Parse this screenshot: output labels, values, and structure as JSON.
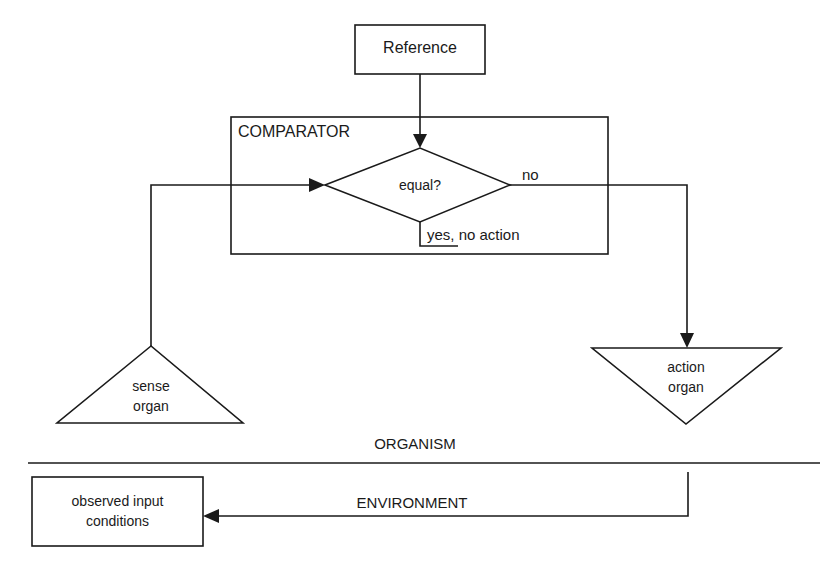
{
  "diagram": {
    "reference": {
      "label": "Reference"
    },
    "comparator": {
      "label": "COMPARATOR",
      "decision": "equal?",
      "no_label": "no",
      "yes_label": "yes, no action"
    },
    "sense_organ": {
      "line1": "sense",
      "line2": "organ"
    },
    "action_organ": {
      "line1": "action",
      "line2": "organ"
    },
    "organism_label": "ORGANISM",
    "environment_label": "ENVIRONMENT",
    "observed_input": {
      "line1": "observed input",
      "line2": "conditions"
    },
    "stroke_color": "#1a1a1a",
    "background_color": "#ffffff"
  }
}
